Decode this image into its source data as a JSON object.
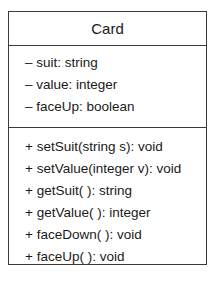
{
  "class": {
    "name": "Card",
    "attributes": [
      "– suit: string",
      "– value: integer",
      "– faceUp: boolean"
    ],
    "operations": [
      "+ setSuit(string s): void",
      "+ setValue(integer v): void",
      "+ getSuit( ): string",
      "+ getValue( ): integer",
      "+ faceDown( ): void",
      "+ faceUp( ): void"
    ]
  }
}
